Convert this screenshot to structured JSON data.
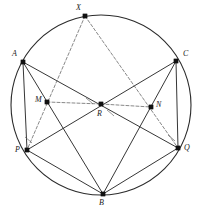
{
  "figure": {
    "background": "#ffffff",
    "stroke_color": "#2b2b2b",
    "dash_color": "#6a6a6a",
    "point_color": "#111111",
    "width": 200,
    "height": 215
  },
  "circle": {
    "cx": 101,
    "cy": 105,
    "r": 90,
    "stroke_width": 1.1
  },
  "points": [
    {
      "id": "X",
      "label": "X",
      "x": 85,
      "y": 16,
      "lx": 76,
      "ly": 4,
      "marker": true
    },
    {
      "id": "A",
      "label": "A",
      "x": 23,
      "y": 62,
      "lx": 12,
      "ly": 50,
      "marker": true
    },
    {
      "id": "C",
      "label": "C",
      "x": 176,
      "y": 61,
      "lx": 183,
      "ly": 50,
      "marker": true
    },
    {
      "id": "M",
      "label": "M",
      "x": 47,
      "y": 102,
      "lx": 35,
      "ly": 96,
      "marker": true
    },
    {
      "id": "R",
      "label": "R",
      "x": 101,
      "y": 104,
      "lx": 97,
      "ly": 110,
      "marker": true
    },
    {
      "id": "N",
      "label": "N",
      "x": 151,
      "y": 107,
      "lx": 156,
      "ly": 101,
      "marker": true
    },
    {
      "id": "P",
      "label": "P",
      "x": 27,
      "y": 150,
      "lx": 15,
      "ly": 146,
      "marker": true
    },
    {
      "id": "Q",
      "label": "Q",
      "x": 178,
      "y": 148,
      "lx": 184,
      "ly": 144,
      "marker": true
    },
    {
      "id": "B",
      "label": "B",
      "x": 103,
      "y": 194,
      "lx": 99,
      "ly": 199,
      "marker": true
    }
  ],
  "solid_segments": [
    {
      "name": "chord-A-P",
      "from": "A",
      "to": "P"
    },
    {
      "name": "chord-A-Q",
      "from": "A",
      "to": "Q"
    },
    {
      "name": "chord-A-B",
      "from": "A",
      "to": "B"
    },
    {
      "name": "chord-C-Q",
      "from": "C",
      "to": "Q"
    },
    {
      "name": "chord-C-P",
      "from": "C",
      "to": "P"
    },
    {
      "name": "chord-C-B",
      "from": "C",
      "to": "B"
    },
    {
      "name": "chord-P-B",
      "from": "P",
      "to": "B"
    },
    {
      "name": "chord-Q-B",
      "from": "Q",
      "to": "B"
    }
  ],
  "dashed_segments": [
    {
      "name": "construction-X-P",
      "from": "X",
      "to": "P"
    },
    {
      "name": "construction-X-Q",
      "from": "X",
      "to": "Q"
    },
    {
      "name": "midline-M-R",
      "from": "M",
      "to": "R"
    },
    {
      "name": "midline-R-N",
      "from": "R",
      "to": "N"
    }
  ],
  "angle_marks": [
    {
      "name": "right-angle-at-R-left",
      "vertex": "R",
      "cx": 91,
      "cy": 98,
      "note": "angle arc between RM and RA"
    },
    {
      "name": "right-angle-at-R-right",
      "vertex": "R",
      "cx": 112,
      "cy": 110,
      "note": "angle arc between RN and RB"
    },
    {
      "name": "angle-at-P",
      "vertex": "P",
      "cx": 30,
      "cy": 137,
      "note": "angle arc between PA and PX"
    },
    {
      "name": "angle-at-Q",
      "vertex": "Q",
      "cx": 173,
      "cy": 135,
      "note": "angle arc between QC and QX"
    }
  ]
}
